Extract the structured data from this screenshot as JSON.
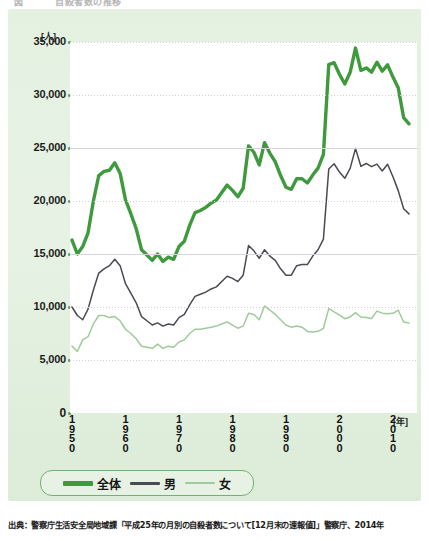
{
  "title_partial": "図 　　　自殺者数の推移",
  "axes": {
    "y_unit": "[人]",
    "y_ticks": [
      "35,000",
      "30,000",
      "25,000",
      "20,000",
      "15,000",
      "10,000",
      "5,000",
      "0"
    ],
    "x_unit": "[年]",
    "x_ticks": [
      "1950",
      "1960",
      "1970",
      "1980",
      "1990",
      "2000",
      "2010"
    ]
  },
  "legend": {
    "items": [
      {
        "label": "全体",
        "color": "#3e9a3c"
      },
      {
        "label": "男",
        "color": "#4a4a55"
      },
      {
        "label": "女",
        "color": "#9ecb9a"
      }
    ]
  },
  "source": "出典：警察庁生活安全局地域課「平成25年の月別の自殺者数について[12月末の速報値]」警察庁、2014年",
  "chart_data": {
    "type": "line",
    "title": "自殺者数の推移",
    "xlabel": "年",
    "ylabel": "人",
    "xlim": [
      1950,
      2013
    ],
    "ylim": [
      0,
      35000
    ],
    "ytick_interval": 5000,
    "grid": true,
    "legend_position": "bottom",
    "x": [
      1950,
      1951,
      1952,
      1953,
      1954,
      1955,
      1956,
      1957,
      1958,
      1959,
      1960,
      1961,
      1962,
      1963,
      1964,
      1965,
      1966,
      1967,
      1968,
      1969,
      1970,
      1971,
      1972,
      1973,
      1974,
      1975,
      1976,
      1977,
      1978,
      1979,
      1980,
      1981,
      1982,
      1983,
      1984,
      1985,
      1986,
      1987,
      1988,
      1989,
      1990,
      1991,
      1992,
      1993,
      1994,
      1995,
      1996,
      1997,
      1998,
      1999,
      2000,
      2001,
      2002,
      2003,
      2004,
      2005,
      2006,
      2007,
      2008,
      2009,
      2010,
      2011,
      2012,
      2013
    ],
    "series": [
      {
        "name": "全体",
        "color": "#3e9a3c",
        "values": [
          16311,
          15000,
          15700,
          17000,
          20000,
          22400,
          22800,
          22900,
          23600,
          22600,
          20100,
          18800,
          17400,
          15400,
          14900,
          14400,
          15000,
          14300,
          14700,
          14500,
          15700,
          16200,
          17700,
          18900,
          19100,
          19400,
          19800,
          20100,
          20800,
          21500,
          21000,
          20400,
          21200,
          25200,
          24600,
          23400,
          25500,
          24500,
          23700,
          22400,
          21300,
          21100,
          22100,
          22100,
          21700,
          22445,
          23104,
          24391,
          32863,
          33048,
          31957,
          31042,
          32143,
          34427,
          32325,
          32552,
          32155,
          33093,
          32249,
          32845,
          31690,
          30651,
          27858,
          27283
        ]
      },
      {
        "name": "男",
        "color": "#4a4a55",
        "values": [
          10000,
          9200,
          8800,
          9800,
          11600,
          13200,
          13600,
          13900,
          14500,
          13900,
          12200,
          11300,
          10400,
          9100,
          8700,
          8300,
          8500,
          8200,
          8400,
          8300,
          9000,
          9300,
          10200,
          11000,
          11200,
          11400,
          11700,
          11900,
          12400,
          12900,
          12700,
          12400,
          13000,
          15800,
          15300,
          14600,
          15400,
          14800,
          14400,
          13600,
          13000,
          13000,
          13900,
          14000,
          14000,
          14800,
          15400,
          16400,
          23013,
          23512,
          22727,
          22144,
          23080,
          24963,
          23272,
          23540,
          23237,
          23478,
          22831,
          23472,
          22283,
          20955,
          19273,
          18787
        ]
      },
      {
        "name": "女",
        "color": "#9ecb9a",
        "values": [
          6311,
          5800,
          6900,
          7200,
          8400,
          9200,
          9200,
          9000,
          9100,
          8700,
          7900,
          7500,
          7000,
          6300,
          6200,
          6100,
          6500,
          6100,
          6300,
          6200,
          6700,
          6900,
          7500,
          7900,
          7900,
          8000,
          8100,
          8200,
          8400,
          8600,
          8300,
          8000,
          8200,
          9400,
          9300,
          8800,
          10100,
          9700,
          9300,
          8800,
          8300,
          8100,
          8200,
          8100,
          7700,
          7645,
          7704,
          7991,
          9850,
          9536,
          9230,
          8898,
          9063,
          9464,
          9053,
          9012,
          8918,
          9615,
          9418,
          9373,
          9407,
          9696,
          8585,
          8496
        ]
      }
    ]
  }
}
